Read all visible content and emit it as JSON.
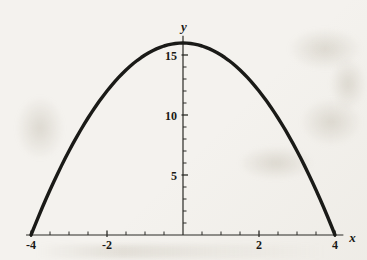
{
  "figure": {
    "background_color": "#f4f2ee",
    "axis_color": "#2b2a26",
    "curve_color": "#1a1a17",
    "text_color": "#1a1915"
  },
  "chart_data": {
    "type": "line",
    "title": "",
    "xlabel": "x",
    "ylabel": "y",
    "equation": {
      "form": "quadratic",
      "a": -1,
      "b": 0,
      "c": 16,
      "description": "y = 16 - x^2"
    },
    "domain": [
      -4,
      4
    ],
    "xlim": [
      -4.13,
      4.22
    ],
    "ylim": [
      0,
      16.6
    ],
    "grid": false,
    "legend": null,
    "x_major_ticks": [
      {
        "value": -4,
        "label": "-4"
      },
      {
        "value": -2,
        "label": "-2"
      },
      {
        "value": 2,
        "label": "2"
      },
      {
        "value": 4,
        "label": "4"
      }
    ],
    "x_minor_step": 0.5,
    "y_major_ticks": [
      {
        "value": 5,
        "label": "5"
      },
      {
        "value": 10,
        "label": "10"
      },
      {
        "value": 15,
        "label": "15"
      }
    ],
    "y_minor_step": 1,
    "points": [
      [
        -4,
        0
      ],
      [
        -3.5,
        3.75
      ],
      [
        -3,
        7
      ],
      [
        -2.5,
        9.75
      ],
      [
        -2,
        12
      ],
      [
        -1.5,
        13.75
      ],
      [
        -1,
        15
      ],
      [
        -0.5,
        15.75
      ],
      [
        0,
        16
      ],
      [
        0.5,
        15.75
      ],
      [
        1,
        15
      ],
      [
        1.5,
        13.75
      ],
      [
        2,
        12
      ],
      [
        2.5,
        9.75
      ],
      [
        3,
        7
      ],
      [
        3.5,
        3.75
      ],
      [
        4,
        0
      ]
    ]
  }
}
